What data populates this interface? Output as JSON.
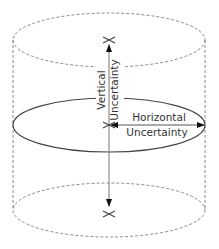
{
  "diagram": {
    "type": "cylinder-uncertainty",
    "colors": {
      "dashed_outline": "#8a8a8a",
      "solid_ellipse": "#444444",
      "arrow": "#555555",
      "arrowhead": "#111111",
      "text": "#333333",
      "background": "#ffffff"
    },
    "labels": {
      "vertical_line1": "Vertical",
      "vertical_line2": "Uncertainty",
      "horizontal_line1": "Horizontal",
      "horizontal_line2": "Uncertainty"
    },
    "shapes": {
      "top_ellipse": {
        "cx": 109,
        "cy": 40,
        "rx": 96,
        "ry": 27,
        "style": "dashed"
      },
      "middle_ellipse": {
        "cx": 109,
        "cy": 125,
        "rx": 96,
        "ry": 27,
        "style": "solid"
      },
      "bottom_ellipse": {
        "cx": 109,
        "cy": 210,
        "rx": 96,
        "ry": 27,
        "style": "dashed"
      },
      "left_side_x": 13,
      "right_side_x": 205
    },
    "markers": [
      "top-x-marker",
      "center-x-marker",
      "bottom-x-marker"
    ]
  }
}
